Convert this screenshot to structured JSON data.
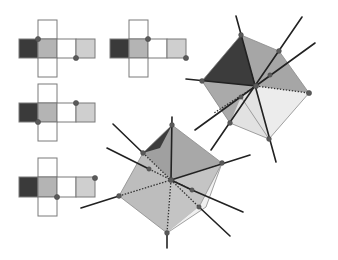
{
  "figure": {
    "colors": {
      "dark": "#3a3a3a",
      "medium": "#b4b4b4",
      "light": "#cfcfcf",
      "white": "#ffffff",
      "outline": "#7a7a7a",
      "dot": "#5a5a5a",
      "line": "#222222"
    },
    "nets": [
      {
        "id": "net-top-left",
        "origin": [
          19,
          20
        ],
        "cell": 19,
        "dots": [
          [
            38,
            39
          ],
          [
            76,
            58
          ]
        ]
      },
      {
        "id": "net-top-right",
        "origin": [
          110,
          20
        ],
        "cell": 19,
        "dots": [
          [
            148,
            39
          ],
          [
            186,
            58
          ]
        ]
      },
      {
        "id": "net-middle-left",
        "origin": [
          19,
          84
        ],
        "cell": 19,
        "dots": [
          [
            38,
            122
          ],
          [
            76,
            103
          ]
        ]
      },
      {
        "id": "net-bottom-left",
        "origin": [
          19,
          158
        ],
        "cell": 19,
        "dots": [
          [
            57,
            197
          ],
          [
            95,
            178
          ]
        ]
      }
    ],
    "net_layout": {
      "cells": [
        {
          "col": 1,
          "row": 0,
          "shade": "white"
        },
        {
          "col": 0,
          "row": 1,
          "shade": "dark"
        },
        {
          "col": 1,
          "row": 1,
          "shade": "medium"
        },
        {
          "col": 2,
          "row": 1,
          "shade": "white"
        },
        {
          "col": 3,
          "row": 1,
          "shade": "light"
        },
        {
          "col": 1,
          "row": 2,
          "shade": "white"
        }
      ]
    },
    "cubes": [
      {
        "id": "cube-right",
        "vertices": {
          "top": [
            241,
            35
          ],
          "upper_right": [
            279,
            51
          ],
          "right": [
            309,
            93
          ],
          "bottom": [
            269,
            139
          ],
          "bottom_left": [
            230,
            123
          ],
          "left": [
            202,
            81
          ],
          "center": [
            256,
            86
          ]
        }
      },
      {
        "id": "cube-left",
        "vertices": {
          "top": [
            172,
            125
          ],
          "right": [
            222,
            163
          ],
          "bottom": [
            167,
            233
          ],
          "left": [
            119,
            196
          ],
          "upper_left": [
            143,
            153
          ],
          "center": [
            171,
            180
          ]
        }
      }
    ]
  }
}
